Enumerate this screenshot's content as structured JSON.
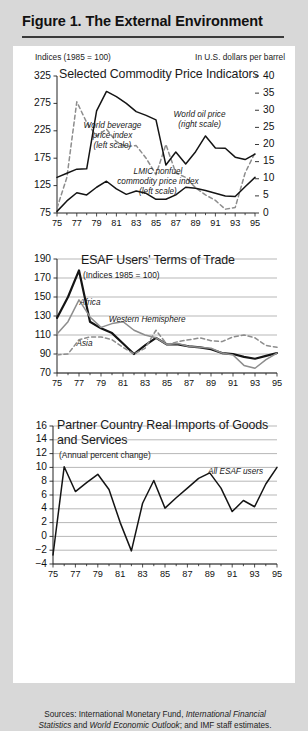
{
  "figure": {
    "title": "Figure 1. The External Environment",
    "sources_prefix": "Sources:  International Monetary Fund, ",
    "sources_italic1": "International Financial Statistics",
    "sources_mid": " and ",
    "sources_italic2": "World Economic Outlook",
    "sources_suffix": "; and IMF staff estimates."
  },
  "colors": {
    "page_background": "#d8d8d8",
    "panel_background": "#ffffff",
    "ink": "#1a1a1a",
    "gridline": "#9a9a9a",
    "series_dark": "#141414",
    "series_gray": "#8d8d8d",
    "series_dashed": "#8d8d8d"
  },
  "chart_data": [
    {
      "id": "commodity-price-indicators",
      "type": "line",
      "title": "Selected Commodity Price Indicators",
      "left_caption": "Indices (1985 = 100)",
      "right_caption": "In U.S. dollars per barrel",
      "xlabel": "",
      "ylabel": "",
      "ylim": [
        75,
        325
      ],
      "yticks": [
        75,
        125,
        175,
        225,
        275,
        325
      ],
      "y2lim": [
        0,
        40
      ],
      "y2ticks": [
        0,
        5,
        10,
        15,
        20,
        25,
        30,
        35,
        40
      ],
      "xlim": [
        1975,
        1995
      ],
      "xticks": [
        1975,
        1977,
        1979,
        1981,
        1983,
        1985,
        1987,
        1989,
        1991,
        1993,
        1995
      ],
      "xticklabels": [
        "75",
        "77",
        "79",
        "81",
        "83",
        "85",
        "87",
        "89",
        "91",
        "93",
        "95"
      ],
      "grid": false,
      "legend": "inline-annotations",
      "annotations": [
        {
          "text": "World beverage price index (left scale)",
          "lines": [
            "World beverage",
            "price index",
            "(left scale)"
          ],
          "x": 1980.6,
          "y": 232
        },
        {
          "text": "LMIC nonfuel commodity price index (left scale)",
          "lines": [
            "LMIC nonfuel",
            "commodity price index",
            "(left scale)"
          ],
          "x": 1985.2,
          "y": 148
        },
        {
          "text": "World oil price (right scale)",
          "lines": [
            "World oil price",
            "(right scale)"
          ],
          "x": 1989.4,
          "y": 252
        }
      ],
      "series": [
        {
          "name": "World beverage price index (left scale)",
          "style": "dashed",
          "axis": "left",
          "x": [
            1975,
            1976,
            1977,
            1978,
            1979,
            1980,
            1981,
            1982,
            1983,
            1984,
            1985,
            1986,
            1987,
            1988,
            1989,
            1990,
            1991,
            1992,
            1993,
            1994,
            1995
          ],
          "values": [
            84,
            140,
            278,
            240,
            215,
            228,
            205,
            196,
            198,
            175,
            145,
            200,
            148,
            140,
            121,
            108,
            98,
            82,
            85,
            148,
            185
          ]
        },
        {
          "name": "LMIC nonfuel commodity price index (left scale)",
          "style": "solid",
          "axis": "left",
          "x": [
            1975,
            1976,
            1977,
            1978,
            1979,
            1980,
            1981,
            1982,
            1983,
            1984,
            1985,
            1986,
            1987,
            1988,
            1989,
            1990,
            1991,
            1992,
            1993,
            1994,
            1995
          ],
          "values": [
            78,
            97,
            112,
            108,
            122,
            133,
            119,
            109,
            115,
            111,
            100,
            100,
            108,
            122,
            120,
            116,
            111,
            106,
            105,
            123,
            140
          ]
        },
        {
          "name": "World oil price (right scale)",
          "style": "solid",
          "axis": "right",
          "x": [
            1975,
            1976,
            1977,
            1978,
            1979,
            1980,
            1981,
            1982,
            1983,
            1984,
            1985,
            1986,
            1987,
            1988,
            1989,
            1990,
            1991,
            1992,
            1993,
            1994,
            1995
          ],
          "values": [
            10.4,
            11.6,
            12.8,
            12.9,
            29.8,
            35.5,
            34.0,
            32.0,
            29.6,
            28.5,
            27.2,
            14.0,
            17.8,
            14.3,
            17.9,
            22.5,
            19.0,
            18.9,
            16.3,
            15.6,
            17.2
          ]
        }
      ]
    },
    {
      "id": "esaf-terms-of-trade",
      "type": "line",
      "title": "ESAF Users' Terms of Trade",
      "subtitle": "(Indices 1985 = 100)",
      "xlabel": "",
      "ylabel": "",
      "ylim": [
        70,
        190
      ],
      "yticks": [
        70,
        90,
        110,
        130,
        150,
        170,
        190
      ],
      "xlim": [
        1975,
        1995
      ],
      "xticks": [
        1975,
        1977,
        1979,
        1981,
        1983,
        1985,
        1987,
        1989,
        1991,
        1993,
        1995
      ],
      "xticklabels": [
        "75",
        "77",
        "79",
        "81",
        "83",
        "85",
        "87",
        "89",
        "91",
        "93",
        "95"
      ],
      "grid": true,
      "legend": "inline-annotations",
      "annotations": [
        {
          "text": "Africa",
          "x": 1978.0,
          "y": 143
        },
        {
          "text": "Western Hemisphere",
          "x": 1983.2,
          "y": 125
        },
        {
          "text": "Asia",
          "x": 1977.5,
          "y": 100
        }
      ],
      "series": [
        {
          "name": "Africa",
          "style": "thick-solid",
          "x": [
            1975,
            1976,
            1977,
            1978,
            1979,
            1980,
            1981,
            1982,
            1983,
            1984,
            1985,
            1986,
            1987,
            1988,
            1989,
            1990,
            1991,
            1992,
            1993,
            1994,
            1995
          ],
          "values": [
            128,
            150,
            178,
            124,
            117,
            112,
            101,
            90,
            99,
            107,
            100,
            100,
            98,
            97,
            95,
            91,
            90,
            87,
            85,
            88,
            91
          ]
        },
        {
          "name": "Western Hemisphere",
          "style": "solid-gray",
          "x": [
            1975,
            1976,
            1977,
            1978,
            1979,
            1980,
            1981,
            1982,
            1983,
            1984,
            1985,
            1986,
            1987,
            1988,
            1989,
            1990,
            1991,
            1992,
            1993,
            1994,
            1995
          ],
          "values": [
            111,
            124,
            147,
            129,
            118,
            122,
            124,
            115,
            110,
            107,
            100,
            101,
            98,
            97,
            96,
            91,
            89,
            78,
            75,
            84,
            91
          ]
        },
        {
          "name": "Asia",
          "style": "dashed",
          "x": [
            1975,
            1976,
            1977,
            1978,
            1979,
            1980,
            1981,
            1982,
            1983,
            1984,
            1985,
            1986,
            1987,
            1988,
            1989,
            1990,
            1991,
            1992,
            1993,
            1994,
            1995
          ],
          "values": [
            89,
            90,
            105,
            108,
            108,
            105,
            97,
            90,
            96,
            115,
            100,
            103,
            105,
            107,
            104,
            103,
            108,
            110,
            107,
            99,
            97
          ]
        }
      ]
    },
    {
      "id": "partner-country-real-imports",
      "type": "line",
      "title": "Partner Country Real Imports of Goods and Services",
      "subtitle": "(Annual percent change)",
      "xlabel": "",
      "ylabel": "",
      "ylim": [
        -4,
        16
      ],
      "yticks": [
        -4,
        -2,
        0,
        2,
        4,
        6,
        8,
        10,
        12,
        14,
        16
      ],
      "yticklabels": [
        "−4",
        "−2",
        "0",
        "2",
        "4",
        "6",
        "8",
        "10",
        "12",
        "14",
        "16"
      ],
      "xlim": [
        1975,
        1995
      ],
      "xticks": [
        1975,
        1977,
        1979,
        1981,
        1983,
        1985,
        1987,
        1989,
        1991,
        1993,
        1995
      ],
      "xticklabels": [
        "75",
        "77",
        "79",
        "81",
        "83",
        "85",
        "87",
        "89",
        "91",
        "93",
        "95"
      ],
      "grid": true,
      "legend": "inline-annotations",
      "annotations": [
        {
          "text": "All ESAF users",
          "x": 1991.3,
          "y": 9.2
        }
      ],
      "series": [
        {
          "name": "All ESAF users",
          "style": "solid",
          "x": [
            1975,
            1976,
            1977,
            1978,
            1979,
            1980,
            1981,
            1982,
            1983,
            1984,
            1985,
            1986,
            1987,
            1988,
            1989,
            1990,
            1991,
            1992,
            1993,
            1994,
            1995
          ],
          "values": [
            -2.7,
            10.1,
            6.5,
            7.8,
            9.0,
            6.8,
            2.0,
            -2.1,
            4.8,
            8.1,
            4.1,
            5.6,
            7.0,
            8.4,
            9.2,
            7.0,
            3.6,
            5.2,
            4.3,
            7.6,
            10.0
          ]
        }
      ]
    }
  ]
}
